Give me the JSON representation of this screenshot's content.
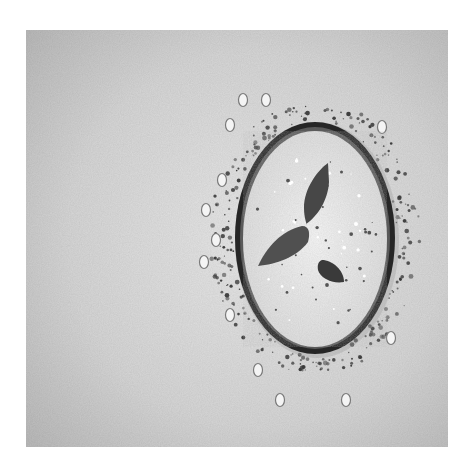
{
  "image": {
    "description": "Grayscale overhead photo of a round dark-rimmed bowl filled with a creamy soup garnished with three leaves, surrounded by scattered seeds and crushed herbs on a textured light surface",
    "colors": {
      "page_background": "#ffffff",
      "surface": "#c9c9c9",
      "surface_light": "#e6e6e6",
      "bowl_rim": "#2b2b2b",
      "soup": "#efefef",
      "leaf": "#4a4a4a",
      "herb_crumbs": "#3a3a3a",
      "seeds": "#f4f4f4"
    }
  }
}
